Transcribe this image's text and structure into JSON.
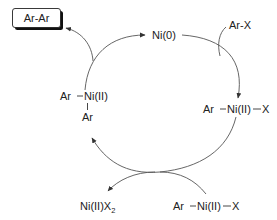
{
  "diagram": {
    "product_box": {
      "label": "Ar-Ar"
    },
    "nodes": {
      "ni0": {
        "label": "Ni(0)"
      },
      "reagent_arx": {
        "label": "Ar-X"
      },
      "oxidative_addition": {
        "ar": "Ar",
        "ni": "Ni(II)",
        "x": "X"
      },
      "diaryl": {
        "ar_left": "Ar",
        "ni": "Ni(II)",
        "ar_bottom": "Ar"
      },
      "byproduct": {
        "main": "Ni(II)X",
        "subscript": "2"
      },
      "second_arnix": {
        "ar": "Ar",
        "ni": "Ni(II)",
        "x": "X"
      }
    },
    "edges": [
      {
        "from": "diaryl",
        "to": "ni0",
        "note": "reductive elimination, releases Ar-Ar"
      },
      {
        "from": "ni0",
        "to": "oxidative_addition",
        "note": "oxidative addition with Ar-X"
      },
      {
        "from": "oxidative_addition",
        "to": "diaryl",
        "note": "transmetalation with Ar-Ni(II)-X, releases Ni(II)X2"
      }
    ],
    "colors": {
      "stroke": "#555555",
      "text": "#222222",
      "box_shadow": "#111111"
    }
  }
}
